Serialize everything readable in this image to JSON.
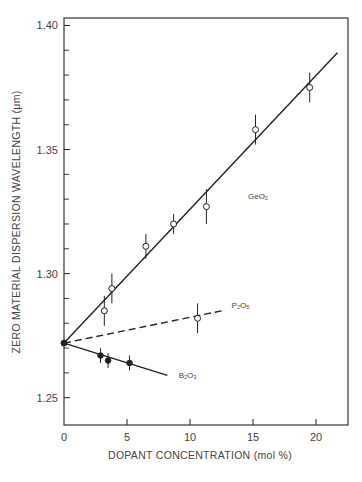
{
  "chart_data": {
    "type": "scatter",
    "title": "",
    "xlabel": "DOPANT CONCENTRATION (mol %)",
    "ylabel": "ZERO MATERIAL DISPERSION WAVELENGTH (μm)",
    "xlim": [
      0,
      22.5
    ],
    "ylim": [
      1.239,
      1.403
    ],
    "x_ticks": [
      0,
      5,
      10,
      15,
      20
    ],
    "x_tick_labels": [
      "0",
      "5",
      "10",
      "15",
      "20"
    ],
    "y_ticks": [
      1.25,
      1.3,
      1.35,
      1.4
    ],
    "y_tick_labels": [
      "1.25",
      "1.30",
      "1.35",
      "1.40"
    ],
    "y_minor_ticks": [
      1.26,
      1.27,
      1.28,
      1.29,
      1.31,
      1.32,
      1.33,
      1.34,
      1.36,
      1.37,
      1.38,
      1.39
    ],
    "grid": false,
    "legend": "inline labels",
    "origin_point": {
      "x": 0,
      "y": 1.272,
      "marker": "filled"
    },
    "series": [
      {
        "name": "GeO₂",
        "label_pos": {
          "x": 14.6,
          "y": 1.33
        },
        "marker": "open-circle",
        "line_style": "solid",
        "fit_line": [
          [
            0,
            1.272
          ],
          [
            21.7,
            1.389
          ]
        ],
        "points": [
          {
            "x": 3.2,
            "y": 1.285,
            "err": 0.006
          },
          {
            "x": 3.8,
            "y": 1.294,
            "err": 0.006
          },
          {
            "x": 6.5,
            "y": 1.311,
            "err": 0.005
          },
          {
            "x": 8.7,
            "y": 1.32,
            "err": 0.004
          },
          {
            "x": 11.3,
            "y": 1.327,
            "err": 0.007
          },
          {
            "x": 15.2,
            "y": 1.358,
            "err": 0.006
          },
          {
            "x": 19.5,
            "y": 1.375,
            "err": 0.006
          }
        ]
      },
      {
        "name": "P₂O₅",
        "label_pos": {
          "x": 13.3,
          "y": 1.286
        },
        "marker": "open-circle",
        "line_style": "dashed",
        "fit_line": [
          [
            0,
            1.272
          ],
          [
            12.5,
            1.285
          ]
        ],
        "points": [
          {
            "x": 10.6,
            "y": 1.282,
            "err": 0.006
          }
        ]
      },
      {
        "name": "B₂O₃",
        "label_pos": {
          "x": 9.1,
          "y": 1.258
        },
        "marker": "filled-circle",
        "line_style": "solid",
        "fit_line": [
          [
            0,
            1.272
          ],
          [
            8.2,
            1.259
          ]
        ],
        "points": [
          {
            "x": 2.9,
            "y": 1.267,
            "err": 0.003
          },
          {
            "x": 3.5,
            "y": 1.265,
            "err": 0.003
          },
          {
            "x": 5.2,
            "y": 1.264,
            "err": 0.003
          }
        ]
      }
    ]
  },
  "labels": {
    "xlabel": "DOPANT CONCENTRATION (mol %)",
    "ylabel": "ZERO MATERIAL DISPERSION WAVELENGTH (μm)"
  },
  "colors": {
    "ink": "#222222",
    "text": "#444444",
    "background": "#ffffff"
  }
}
